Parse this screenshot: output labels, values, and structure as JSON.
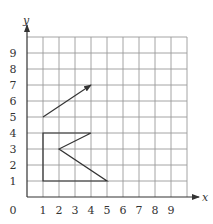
{
  "chart_data": {
    "type": "diagram",
    "title": "",
    "xlabel": "x",
    "ylabel": "y",
    "xlim": [
      0,
      10
    ],
    "ylim": [
      0,
      10
    ],
    "grid": true,
    "x_ticks": [
      "1",
      "2",
      "3",
      "4",
      "5",
      "6",
      "7",
      "8",
      "9"
    ],
    "y_ticks": [
      "1",
      "2",
      "3",
      "4",
      "5",
      "6",
      "7",
      "8",
      "9"
    ],
    "origin_label": "0",
    "shapes": [
      {
        "name": "vector-arrow",
        "type": "arrow",
        "from": [
          1,
          5
        ],
        "to": [
          4,
          7
        ]
      },
      {
        "name": "polygon-shape",
        "type": "polygon",
        "points": [
          [
            1,
            1
          ],
          [
            1,
            4
          ],
          [
            4,
            4
          ],
          [
            2,
            3
          ],
          [
            5,
            1
          ]
        ]
      }
    ]
  },
  "axes": {
    "x_label": "x",
    "y_label": "y",
    "origin": "0"
  }
}
